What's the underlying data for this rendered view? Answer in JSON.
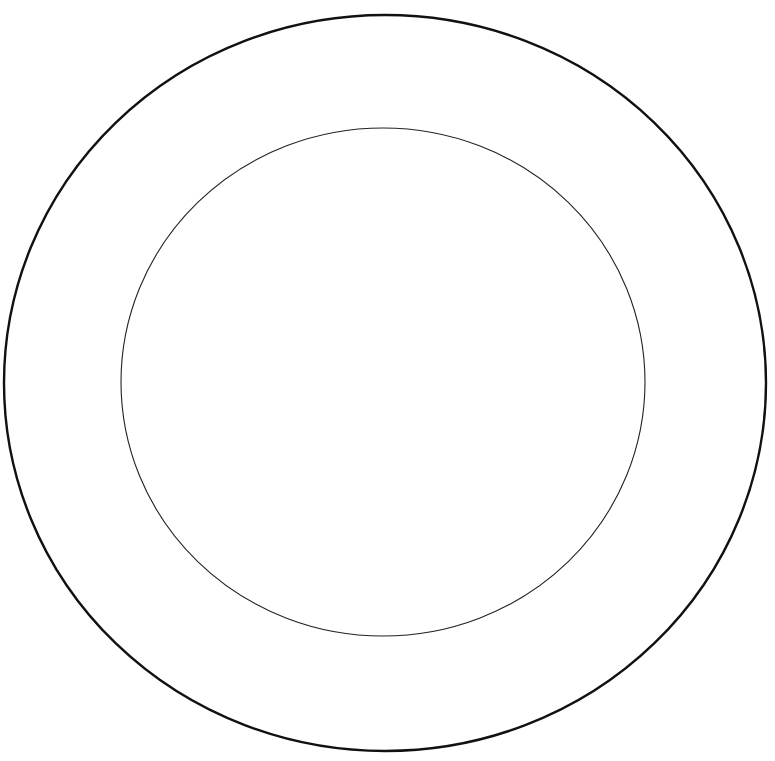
{
  "figure": {
    "background": "#ffffff",
    "width": 775,
    "height": 761,
    "shapes": [
      {
        "name": "outer-rim",
        "type": "ellipse",
        "cx": 385,
        "cy": 383,
        "rx": 381,
        "ry": 368,
        "stroke": "#111111",
        "stroke_width": 2.4
      },
      {
        "name": "inner-well",
        "type": "ellipse",
        "cx": 383,
        "cy": 382,
        "rx": 262,
        "ry": 254,
        "stroke": "#222222",
        "stroke_width": 1.1
      }
    ]
  }
}
